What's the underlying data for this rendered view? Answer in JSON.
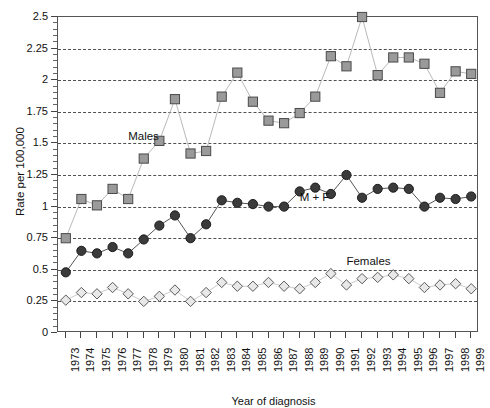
{
  "chart_data": {
    "type": "line",
    "title": "",
    "xlabel": "Year of diagnosis",
    "ylabel": "Rate per 100,000",
    "ylim": [
      0,
      2.5
    ],
    "ytick_labels": [
      "0",
      "0.25",
      "0.5",
      "0.75",
      "1",
      "1.25",
      "1.5",
      "1.75",
      "2",
      "2.25",
      "2.5"
    ],
    "ytick_values": [
      0,
      0.25,
      0.5,
      0.75,
      1,
      1.25,
      1.5,
      1.75,
      2,
      2.25,
      2.5
    ],
    "grid": "horizontal-dashed",
    "legend_position": "inline-annotations",
    "categories": [
      "1973",
      "1974",
      "1975",
      "1976",
      "1977",
      "1978",
      "1979",
      "1980",
      "1981",
      "1982",
      "1983",
      "1984",
      "1985",
      "1986",
      "1987",
      "1988",
      "1989",
      "1990",
      "1991",
      "1992",
      "1993",
      "1994",
      "1995",
      "1996",
      "1997",
      "1998",
      "1999"
    ],
    "series": [
      {
        "name": "Males",
        "marker": "square",
        "marker_fill": "#9a9a9a",
        "marker_edge": "#4a4a4a",
        "line_color": "#b9b9b9",
        "values": [
          0.75,
          1.06,
          1.01,
          1.14,
          1.06,
          1.38,
          1.52,
          1.85,
          1.42,
          1.44,
          1.87,
          2.06,
          1.83,
          1.68,
          1.66,
          1.74,
          1.87,
          2.19,
          2.11,
          2.5,
          2.04,
          2.18,
          2.18,
          2.13,
          1.9,
          2.07,
          2.05
        ]
      },
      {
        "name": "M + F",
        "marker": "circle",
        "marker_fill": "#3b3b3b",
        "marker_edge": "#1c1c1c",
        "line_color": "#555555",
        "values": [
          0.48,
          0.65,
          0.63,
          0.68,
          0.63,
          0.74,
          0.85,
          0.93,
          0.75,
          0.86,
          1.05,
          1.03,
          1.02,
          1.0,
          1.0,
          1.12,
          1.15,
          1.1,
          1.25,
          1.07,
          1.14,
          1.15,
          1.14,
          1.0,
          1.07,
          1.06,
          1.08
        ]
      },
      {
        "name": "Females",
        "marker": "diamond",
        "marker_fill": "#e8e8e8",
        "marker_edge": "#5a5a5a",
        "line_color": "#cccccc",
        "values": [
          0.26,
          0.32,
          0.31,
          0.36,
          0.31,
          0.25,
          0.29,
          0.34,
          0.25,
          0.32,
          0.4,
          0.37,
          0.37,
          0.4,
          0.37,
          0.35,
          0.4,
          0.47,
          0.38,
          0.43,
          0.44,
          0.46,
          0.43,
          0.36,
          0.38,
          0.39,
          0.35
        ]
      }
    ],
    "annotations": [
      {
        "text": "Males",
        "x_year": "1977",
        "y_value": 1.55
      },
      {
        "text": "M + F",
        "x_year": "1988",
        "y_value": 1.07
      },
      {
        "text": "Females",
        "x_year": "1991",
        "y_value": 0.56
      }
    ]
  }
}
